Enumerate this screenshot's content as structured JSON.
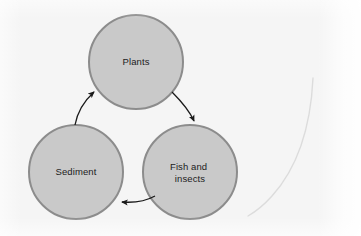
{
  "figure": {
    "name": "aquatic-nutrient-cycle-diagram",
    "type": "cycle-diagram",
    "background_color": "#f5f5f5",
    "width": 361,
    "height": 236
  },
  "style": {
    "node_fill": "#c9c9c9",
    "node_stroke": "#8c8c8c",
    "node_stroke_width": 2,
    "arrow_color": "#1a1a1a",
    "label_color": "#1c1c1c",
    "artifact_color": "#dcdcdc"
  },
  "nodes": [
    {
      "id": "plants",
      "label": "Plants",
      "lines": [
        "Plants"
      ],
      "cx": 136,
      "cy": 62,
      "r": 47
    },
    {
      "id": "fish-and-insects",
      "label": "Fish and insects",
      "lines": [
        "Fish and",
        "insects"
      ],
      "cx": 190,
      "cy": 172,
      "r": 47
    },
    {
      "id": "sediment",
      "label": "Sediment",
      "lines": [
        "Sediment"
      ],
      "cx": 76,
      "cy": 172,
      "r": 47
    }
  ],
  "arrows": [
    {
      "id": "plants-to-fish",
      "from": "plants",
      "to": "fish-and-insects",
      "direction": "clockwise"
    },
    {
      "id": "fish-to-sediment",
      "from": "fish-and-insects",
      "to": "sediment",
      "direction": "clockwise"
    },
    {
      "id": "sediment-to-plants",
      "from": "sediment",
      "to": "plants",
      "direction": "clockwise"
    }
  ],
  "artifacts": [
    {
      "id": "faint-curve",
      "description": "faint light gray curved line at right margin"
    }
  ]
}
